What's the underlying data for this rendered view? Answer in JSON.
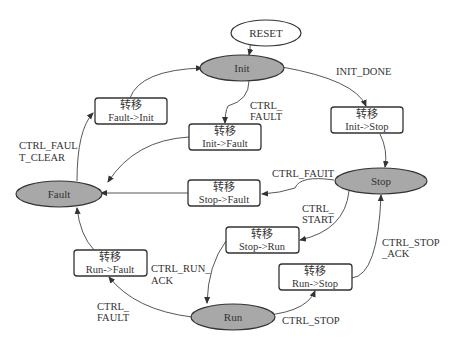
{
  "diagram": {
    "type": "state-machine",
    "start": {
      "label": "RESET"
    },
    "states": [
      {
        "id": "init",
        "label": "Init"
      },
      {
        "id": "stop",
        "label": "Stop"
      },
      {
        "id": "fault",
        "label": "Fault"
      },
      {
        "id": "run",
        "label": "Run"
      }
    ],
    "transitions": [
      {
        "title": "转移",
        "label": "Fault->Init"
      },
      {
        "title": "转移",
        "label": "Init->Fault"
      },
      {
        "title": "转移",
        "label": "Init->Stop"
      },
      {
        "title": "转移",
        "label": "Stop->Fault"
      },
      {
        "title": "转移",
        "label": "Stop->Run"
      },
      {
        "title": "转移",
        "label": "Run->Fault"
      },
      {
        "title": "转移",
        "label": "Run->Stop"
      }
    ],
    "events": {
      "init_done": "INIT_DONE",
      "ctrl_fault_init": [
        "CTRL_",
        "FAULT"
      ],
      "ctrl_fault_clear": [
        "CTRL_FAUL",
        "T_CLEAR"
      ],
      "ctrl_fault_stop": "CTRL_FAUIT",
      "ctrl_start": [
        "CTRL_",
        "START"
      ],
      "ctrl_run_ack": [
        "CTRL_RUN_",
        "ACK"
      ],
      "ctrl_stop_ack": [
        "CTRL_STOP",
        "_ACK"
      ],
      "ctrl_fault_run": [
        "CTRL_",
        "FAULT"
      ],
      "ctrl_stop": "CTRL_STOP"
    }
  }
}
